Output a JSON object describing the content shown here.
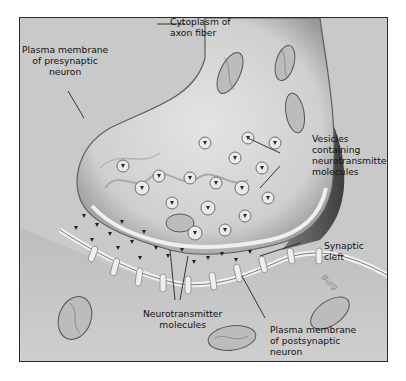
{
  "figure": {
    "labels": {
      "cytoplasm": "Cytoplasm of\naxon fiber",
      "presynaptic_membrane": "Plasma membrane\nof presynaptic\nneuron",
      "vesicles": "Vesicles\ncontaining\nneurotransmitter\nmolecules",
      "synaptic_cleft": "Synaptic\ncleft",
      "neurotransmitters": "Neurotransmitter\nmolecules",
      "postsynaptic_membrane": "Plasma membrane\nof postsynaptic\nneuron"
    },
    "signature": "Burg",
    "colors": {
      "background": "#c9c9c9",
      "frame": "#2a2a2a",
      "axon_fill": "#d8d8d8",
      "axon_edge": "#6a6a6a",
      "membrane": "#efefef",
      "dark_shade": "#5e5e5e",
      "text": "#111111"
    }
  }
}
